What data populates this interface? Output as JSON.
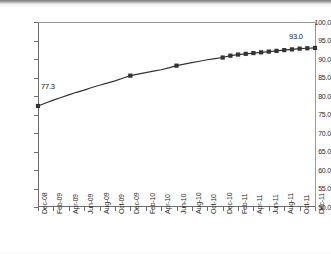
{
  "chart_data": {
    "type": "line",
    "title": "",
    "subtitle": "",
    "xlabel": "",
    "ylabel": "",
    "ylim": [
      50.0,
      100.0
    ],
    "ytick_step": 5.0,
    "grid": false,
    "legend": null,
    "legend_position": "none",
    "marker": "square",
    "series_color": "#333333",
    "x_tick_labels": [
      "Dec-08",
      "Feb-09",
      "Apr-09",
      "Jun-09",
      "Aug-09",
      "Oct-09",
      "Dec-09",
      "Feb-10",
      "Apr-10",
      "Jun-10",
      "Aug-10",
      "Oct-10",
      "Dec-10",
      "Feb-11",
      "Apr-11",
      "Jun-11",
      "Aug-11",
      "Oct-11",
      "Dec-11"
    ],
    "y_tick_labels": [
      "100.0",
      "95.0",
      "90.0",
      "85.0",
      "80.0",
      "75.0",
      "70.0",
      "65.0",
      "60.0",
      "55.0",
      "50.0"
    ],
    "x": [
      "Dec-08",
      "Jan-09",
      "Feb-09",
      "Mar-09",
      "Apr-09",
      "May-09",
      "Jun-09",
      "Jul-09",
      "Aug-09",
      "Sep-09",
      "Oct-09",
      "Nov-09",
      "Dec-09",
      "Jan-10",
      "Feb-10",
      "Mar-10",
      "Apr-10",
      "May-10",
      "Jun-10",
      "Jul-10",
      "Aug-10",
      "Sep-10",
      "Oct-10",
      "Nov-10",
      "Dec-10",
      "Jan-11",
      "Feb-11",
      "Mar-11",
      "Apr-11",
      "May-11",
      "Jun-11",
      "Jul-11",
      "Aug-11",
      "Sep-11",
      "Oct-11",
      "Nov-11",
      "Dec-11"
    ],
    "values": [
      77.3,
      78.1,
      78.9,
      79.6,
      80.3,
      81.0,
      81.6,
      82.3,
      82.9,
      83.5,
      84.1,
      84.8,
      85.5,
      85.9,
      86.3,
      86.7,
      87.1,
      87.6,
      88.2,
      88.6,
      89.0,
      89.4,
      89.8,
      90.1,
      90.4,
      90.9,
      91.2,
      91.4,
      91.6,
      91.8,
      92.0,
      92.2,
      92.4,
      92.6,
      92.8,
      92.9,
      93.0
    ],
    "marked_points": [
      "Dec-08",
      "Dec-09",
      "Jun-10",
      "Dec-10",
      "Jan-11",
      "Feb-11",
      "Mar-11",
      "Apr-11",
      "May-11",
      "Jun-11",
      "Jul-11",
      "Aug-11",
      "Sep-11",
      "Oct-11",
      "Nov-11",
      "Dec-11"
    ],
    "annotations": [
      {
        "name": "first-value-label",
        "text": "77.3",
        "x": "Dec-08",
        "y": 77.3
      },
      {
        "name": "last-value-label",
        "text": "93.0",
        "x": "Dec-11",
        "y": 93.0
      }
    ]
  }
}
